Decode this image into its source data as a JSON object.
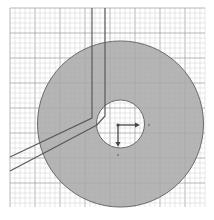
{
  "viewport": {
    "name": "cad-3d-viewport",
    "background": "#ffffff",
    "grid": {
      "x0": 10,
      "y0": 8,
      "x1": 205,
      "y1": 207,
      "minor_spacing": 5,
      "minor_color": "#cfcfcf",
      "major_every": 5,
      "major_color": "#9a9a9a"
    },
    "disc": {
      "cx": 120.5,
      "cy": 124,
      "outer_r": 83,
      "inner_r": 24,
      "fill": "#a8a8a8",
      "stroke": "#6a6a6a"
    },
    "path_lines": {
      "color": "#5a5a5a",
      "lines": [
        {
          "points": "92,8 92,118 10,157"
        },
        {
          "points": "105,8 105,116 97,125 10,171"
        }
      ]
    },
    "ucs_icon": {
      "origin_x": 118,
      "origin_y": 125,
      "x_axis_end": 137,
      "y_axis_end": 144,
      "x_dot": 149,
      "y_dot": 155,
      "color": "#444444",
      "x_label": "",
      "y_label": ""
    }
  }
}
